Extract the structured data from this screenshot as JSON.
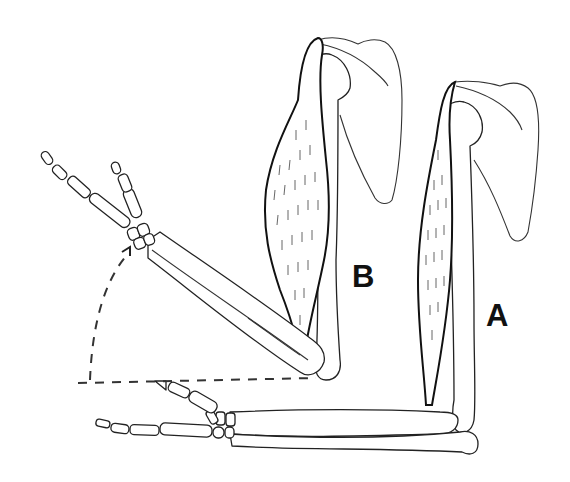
{
  "figure": {
    "type": "anatomical line drawing",
    "labels": {
      "a": "A",
      "b": "B"
    },
    "annotations": {
      "motion_arrow": "dashed arc arrow from horizontal forearm position to raised forearm position",
      "reference_line": "horizontal dashed line through elbow of arm B"
    },
    "colors": {
      "line": "#222222",
      "background": "#ffffff"
    }
  }
}
